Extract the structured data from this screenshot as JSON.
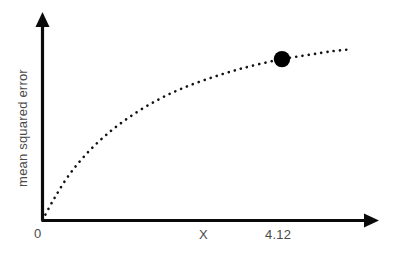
{
  "figure": {
    "background_color": "#ffffff",
    "ink_color": "#000000",
    "text_color": "#4a4a4a"
  },
  "chart_data": {
    "type": "line",
    "title": "",
    "subtitle": "",
    "xlabel": "X",
    "ylabel": "mean squared error",
    "grid": false,
    "legend": null,
    "line_style": "dotted",
    "line_color": "#111111",
    "axis_arrows": true,
    "xlim": [
      0,
      5.6
    ],
    "ylim": [
      0,
      1.08
    ],
    "x_tick_labels": [
      "0",
      "X",
      "4.12"
    ],
    "y_tick_labels": [],
    "series": [
      {
        "name": "mean squared error curve",
        "style": "dotted",
        "x": [
          0,
          0.2,
          0.45,
          0.75,
          1.1,
          1.5,
          1.95,
          2.4,
          2.9,
          3.4,
          3.9,
          4.12,
          4.6,
          5.0,
          5.3
        ],
        "y": [
          0,
          0.12,
          0.25,
          0.37,
          0.48,
          0.58,
          0.67,
          0.74,
          0.8,
          0.85,
          0.89,
          0.905,
          0.93,
          0.95,
          0.96
        ]
      }
    ],
    "annotations": [
      {
        "name": "highlighted-point",
        "marker": "filled-circle",
        "x": 4.12,
        "y": 0.905,
        "label": "4.12",
        "color": "#000000"
      }
    ],
    "axis_labels": {
      "origin": "0",
      "x_axis_generic": "X",
      "x_point": "4.12"
    }
  }
}
